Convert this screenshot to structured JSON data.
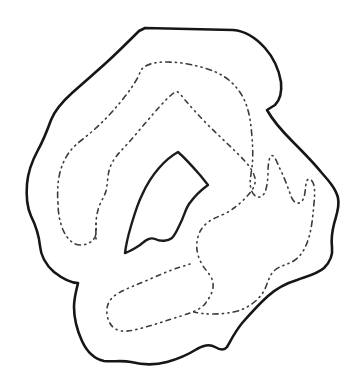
{
  "figure": {
    "type": "hand-drawn-contour-diagram",
    "canvas": {
      "width": 354,
      "height": 390,
      "background_color": "#ffffff"
    },
    "colors": {
      "solid_line": "#161616",
      "dashed_line": "#3c3c3c",
      "background": "#ffffff"
    },
    "curves": {
      "outer_boundary": {
        "name": "outer solid boundary",
        "style": "solid",
        "stroke_width": 2.6,
        "path": "M 145,28 L 233,30 C 245,31 256,38 265,48 C 273,57 279,70 281,82 C 282,92 280,100 275,105 L 267,110 C 272,119 280,129 293,142 C 305,154 313,162 321,172 C 329,181 336,189 338,198 C 340,207 336,216 334,224 C 332,232 331,239 332,247 C 333,255 330,262 324,268 C 317,274 308,276 297,280 C 287,283 277,288 268,296 C 259,304 251,313 243,322 C 236,330 231,340 227,347 C 224,351 220,350 215,347 C 210,344 204,345 197,349 C 189,354 178,359 167,362 C 156,365 143,365 131,362 C 122,360 113,362 104,361 C 95,359 87,352 82,341 C 77,330 74,318 74,307 C 74,297 77,288 78,283 C 72,283 63,279 54,272 C 46,265 41,257 40,246 C 39,236 36,226 31,216 C 27,207 26,196 27,184 C 28,172 32,161 38,150 C 43,141 47,131 51,120 C 55,110 62,102 72,93 C 83,83 95,73 107,62 C 119,51 131,39 139,31 Z"
      },
      "inner_island": {
        "name": "inner solid island boundary",
        "style": "solid",
        "stroke_width": 2.4,
        "path": "M 178,152 C 185,158 193,167 200,175 L 208,185 C 201,190 194,197 189,204 C 185,210 184,216 181,222 C 178,228 176,234 172,238 C 168,241 161,242 155,239 C 150,237 146,240 140,245 C 134,249 128,252 125,253 C 126,245 128,236 131,226 C 134,216 137,205 142,195 C 146,186 152,176 159,168 C 165,161 171,156 178,152 Z"
      },
      "dashed_contour_outer": {
        "name": "outer dash-dot contour level curve",
        "style": "dash-dot",
        "stroke_width": 1.6,
        "path": "M 58,203 C 57,190 58,176 62,166 C 66,155 72,147 83,139 C 93,131 102,123 111,113 C 120,103 130,91 137,79 C 140,73 141,69 144,67 C 150,63 158,62 167,62 C 178,62 190,64 201,67 C 212,70 222,74 230,81 C 238,88 244,97 247,107 C 250,116 251,125 252,137 C 253,149 253,158 252,167 C 251,176 249,181 251,189 C 253,196 258,199 262,196 C 266,193 267,186 268,176 C 268,168 268,160 271,156 C 274,153 277,163 281,171 C 285,179 288,188 291,196 C 293,202 297,205 301,202 C 305,199 305,191 306,184 C 306,180 309,177 312,181 C 315,185 315,193 314,203 C 313,214 312,227 309,237 C 306,247 302,255 295,260 C 288,265 281,265 275,270 C 269,275 268,283 264,291 C 259,299 252,305 243,309 C 234,313 222,314 212,314 C 204,314 198,313 194,312 M 58,203 C 58,213 60,224 64,232 C 68,240 74,245 80,245 C 86,245 92,243 95,237 C 97,232 96,226 96,220"
      },
      "dashed_contour_inner": {
        "name": "inner dash-dot contour level curve",
        "style": "dash-dot",
        "stroke_width": 1.6,
        "path": "M 96,239 C 96,230 95,221 98,210 C 100,202 104,198 106,191 C 108,183 107,174 111,165 C 115,156 123,149 130,141 C 138,132 146,122 154,113 C 161,105 169,96 175,92 C 178,90 181,95 185,100 C 192,108 200,117 209,126 C 218,135 228,144 237,153 C 244,160 251,167 254,175 C 257,182 254,188 249,194 C 243,201 236,207 228,212 C 221,216 213,218 207,223 C 201,228 198,234 197,242 C 196,250 198,258 203,266 C 207,272 212,276 213,283 C 214,290 210,298 204,305 C 198,311 190,313 181,316 C 171,319 160,323 149,326 C 139,329 128,332 122,331 C 113,330 108,323 107,314 C 106,306 109,299 117,294 C 125,289 136,285 148,280 C 159,275 171,270 180,267 C 184,266 187,265 190,264"
      }
    }
  }
}
